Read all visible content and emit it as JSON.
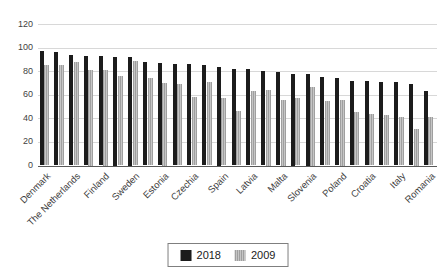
{
  "chart_data": {
    "type": "bar",
    "title": "",
    "categories": [
      "Denmark",
      "",
      "The Netherlands",
      "",
      "Finland",
      "",
      "Sweden",
      "",
      "Estonia",
      "",
      "Czechia",
      "",
      "Spain",
      "",
      "Latvia",
      "",
      "Malta",
      "",
      "Slovenia",
      "",
      "Poland",
      "",
      "Croatia",
      "",
      "Italy",
      "",
      "Romania"
    ],
    "series": [
      {
        "name": "2018",
        "color": "#1c1c1c",
        "values": [
          97,
          96,
          94,
          93,
          93,
          92,
          92,
          88,
          87,
          86,
          86,
          85,
          84,
          82,
          82,
          80,
          79,
          78,
          78,
          75,
          74,
          72,
          72,
          71,
          71,
          69,
          63
        ]
      },
      {
        "name": "2009",
        "color": "#b2b2b2",
        "values": [
          85,
          85,
          88,
          81,
          81,
          76,
          89,
          74,
          70,
          69,
          58,
          71,
          57,
          46,
          63,
          64,
          56,
          57,
          67,
          55,
          56,
          45,
          44,
          43,
          41,
          31,
          41
        ]
      }
    ],
    "xlabel": "",
    "ylabel": "",
    "ylim": [
      0,
      120
    ],
    "yticks": [
      0,
      20,
      40,
      60,
      80,
      100,
      120
    ],
    "grid": "horizontal",
    "legend_position": "bottom-center",
    "bar_colors": {
      "2018": "#1c1c1c",
      "2009": "#b2b2b2"
    }
  }
}
